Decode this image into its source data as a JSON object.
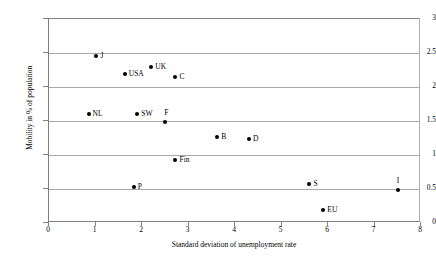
{
  "chart_data": {
    "type": "scatter",
    "title": "",
    "xlabel": "Standard deviation of unemployment rate",
    "ylabel": "Mobility in % of population",
    "xlim": [
      0,
      8
    ],
    "ylim": [
      0,
      3
    ],
    "xticks": [
      "0",
      "1",
      "2",
      "3",
      "4",
      "5",
      "6",
      "7",
      "8"
    ],
    "yticks": [
      "0",
      "0.5",
      "1",
      "1.5",
      "2",
      "2.5",
      "3"
    ],
    "xtick_values": [
      0,
      1,
      2,
      3,
      4,
      5,
      6,
      7,
      8
    ],
    "ytick_values": [
      0,
      0.5,
      1,
      1.5,
      2,
      2.5,
      3
    ],
    "grid": "horizontal",
    "legend": "none",
    "marker_color": "#000000",
    "gridline_color": "#a8a8a8",
    "axis_color": "#808080",
    "points": [
      {
        "label": "J",
        "x": 1.02,
        "y": 2.45,
        "label_pos": "side"
      },
      {
        "label": "USA",
        "x": 1.63,
        "y": 2.19,
        "label_pos": "side"
      },
      {
        "label": "UK",
        "x": 2.2,
        "y": 2.29,
        "label_pos": "side"
      },
      {
        "label": "C",
        "x": 2.72,
        "y": 2.14,
        "label_pos": "side"
      },
      {
        "label": "NL",
        "x": 0.85,
        "y": 1.6,
        "label_pos": "side"
      },
      {
        "label": "SW",
        "x": 1.9,
        "y": 1.6,
        "label_pos": "side"
      },
      {
        "label": "F",
        "x": 2.5,
        "y": 1.49,
        "label_pos": "above"
      },
      {
        "label": "B",
        "x": 3.62,
        "y": 1.26,
        "label_pos": "side"
      },
      {
        "label": "D",
        "x": 4.3,
        "y": 1.23,
        "label_pos": "side"
      },
      {
        "label": "Fin",
        "x": 2.72,
        "y": 0.92,
        "label_pos": "side"
      },
      {
        "label": "P",
        "x": 1.82,
        "y": 0.53,
        "label_pos": "side"
      },
      {
        "label": "S",
        "x": 5.6,
        "y": 0.58,
        "label_pos": "side"
      },
      {
        "label": "I",
        "x": 7.5,
        "y": 0.49,
        "label_pos": "above"
      },
      {
        "label": "EU",
        "x": 5.9,
        "y": 0.19,
        "label_pos": "side"
      }
    ]
  }
}
